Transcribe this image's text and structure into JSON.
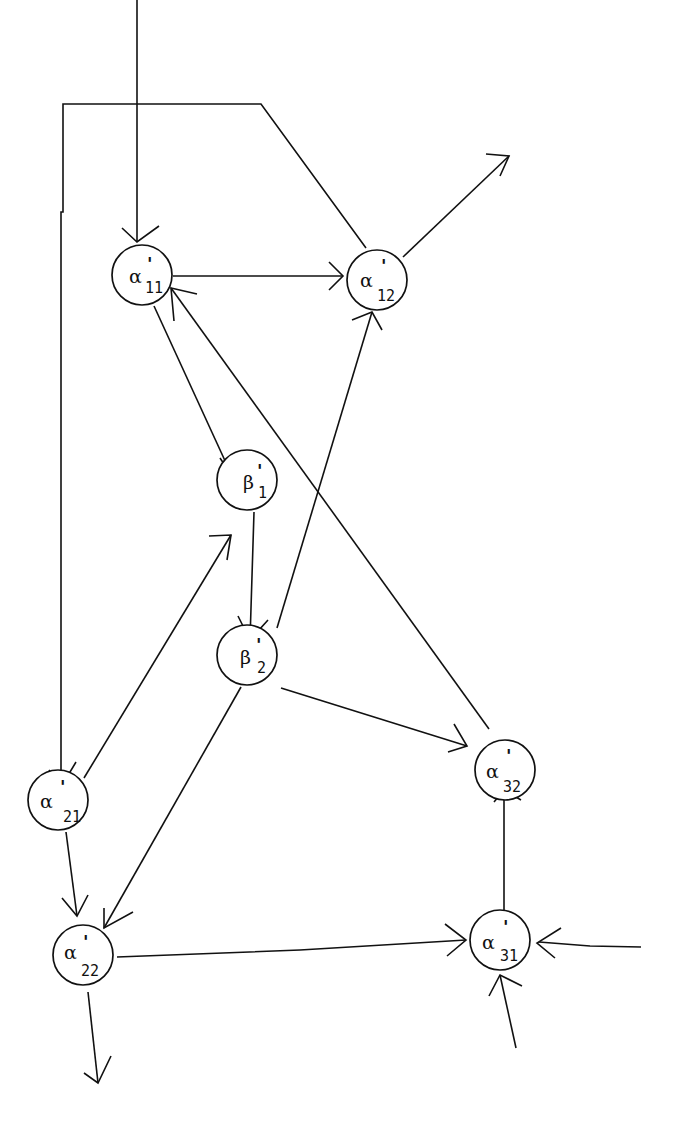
{
  "diagram": {
    "type": "directed-graph",
    "nodes": [
      {
        "id": "a11",
        "symbol": "α",
        "prime": "'",
        "sub": "11",
        "x": 142,
        "y": 275
      },
      {
        "id": "a12",
        "symbol": "α",
        "prime": "'",
        "sub": "12",
        "x": 377,
        "y": 280
      },
      {
        "id": "b1",
        "symbol": "β",
        "prime": "'",
        "sub": "1",
        "x": 247,
        "y": 480
      },
      {
        "id": "b2",
        "symbol": "β",
        "prime": "'",
        "sub": "2",
        "x": 247,
        "y": 655
      },
      {
        "id": "a32",
        "symbol": "α",
        "prime": "'",
        "sub": "32",
        "x": 505,
        "y": 770
      },
      {
        "id": "a21",
        "symbol": "α",
        "prime": "'",
        "sub": "21",
        "x": 58,
        "y": 800
      },
      {
        "id": "a22",
        "symbol": "α",
        "prime": "'",
        "sub": "22",
        "x": 83,
        "y": 955
      },
      {
        "id": "a31",
        "symbol": "α",
        "prime": "'",
        "sub": "31",
        "x": 500,
        "y": 940
      }
    ],
    "edges": [
      {
        "from": "external-top",
        "to": "a11"
      },
      {
        "from": "a12",
        "to": "a21",
        "via": "top-left bus"
      },
      {
        "from": "a11",
        "to": "a12"
      },
      {
        "from": "a12",
        "to": "external-top-right"
      },
      {
        "from": "a11",
        "to": "b1"
      },
      {
        "from": "b1",
        "to": "b2"
      },
      {
        "from": "b2",
        "to": "a12"
      },
      {
        "from": "b2",
        "to": "a32"
      },
      {
        "from": "a32",
        "to": "a11"
      },
      {
        "from": "a21",
        "to": "b1"
      },
      {
        "from": "a21",
        "to": "a22"
      },
      {
        "from": "b2",
        "to": "a22"
      },
      {
        "from": "a22",
        "to": "a31"
      },
      {
        "from": "a22",
        "to": "external-bottom"
      },
      {
        "from": "a31",
        "to": "a32"
      },
      {
        "from": "external-right",
        "to": "a31"
      },
      {
        "from": "external-bottom-right",
        "to": "a31"
      }
    ]
  }
}
